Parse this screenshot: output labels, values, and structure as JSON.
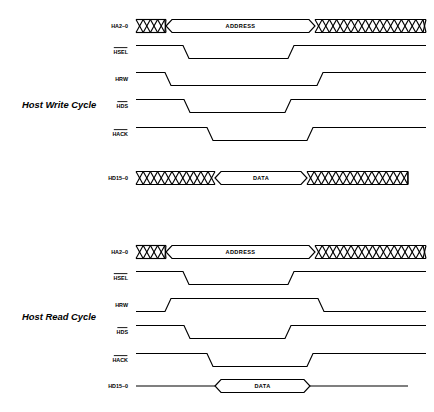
{
  "figure": {
    "title_faint": "",
    "width": 434,
    "height": 412,
    "background_color": "#ffffff",
    "line_color": "#000000"
  },
  "cycles": [
    {
      "id": "write",
      "title": "Host Write Cycle",
      "signals": [
        {
          "name": "HA2-0",
          "label": "HA2–0",
          "overbar": false,
          "type": "bus",
          "segments": [
            {
              "kind": "hatched",
              "start": 136,
              "end": 166
            },
            {
              "kind": "valid",
              "start": 166,
              "end": 315,
              "text": "ADDRESS"
            },
            {
              "kind": "hatched",
              "start": 315,
              "end": 426
            }
          ]
        },
        {
          "name": "HSEL",
          "label": "HSEL",
          "overbar": true,
          "type": "logic",
          "initial": "high",
          "transitions": [
            {
              "at": 183,
              "to": "low"
            },
            {
              "at": 288,
              "to": "high"
            }
          ]
        },
        {
          "name": "HRW",
          "label": "HRW",
          "overbar": false,
          "type": "logic",
          "initial": "high",
          "transitions": [
            {
              "at": 165,
              "to": "low"
            },
            {
              "at": 317,
              "to": "high"
            }
          ]
        },
        {
          "name": "HDS",
          "label": "HDS",
          "overbar": true,
          "type": "logic",
          "initial": "high",
          "transitions": [
            {
              "at": 184,
              "to": "low"
            },
            {
              "at": 285,
              "to": "high"
            }
          ]
        },
        {
          "name": "HACK",
          "label": "HACK",
          "overbar": true,
          "type": "logic",
          "initial": "high",
          "transitions": [
            {
              "at": 207,
              "to": "low"
            },
            {
              "at": 307,
              "to": "high"
            }
          ]
        },
        {
          "name": "HD15-0",
          "label": "HD15–0",
          "overbar": false,
          "type": "bus",
          "segments": [
            {
              "kind": "hatched",
              "start": 136,
              "end": 215
            },
            {
              "kind": "valid",
              "start": 215,
              "end": 307,
              "text": "DATA"
            },
            {
              "kind": "hatched",
              "start": 307,
              "end": 408
            }
          ]
        }
      ]
    },
    {
      "id": "read",
      "title": "Host Read Cycle",
      "signals": [
        {
          "name": "HA2-0",
          "label": "HA2–0",
          "overbar": false,
          "type": "bus",
          "segments": [
            {
              "kind": "hatched",
              "start": 136,
              "end": 166
            },
            {
              "kind": "valid",
              "start": 166,
              "end": 315,
              "text": "ADDRESS"
            },
            {
              "kind": "hatched",
              "start": 315,
              "end": 426
            }
          ]
        },
        {
          "name": "HSEL",
          "label": "HSEL",
          "overbar": true,
          "type": "logic",
          "initial": "high",
          "transitions": [
            {
              "at": 183,
              "to": "low"
            },
            {
              "at": 288,
              "to": "high"
            }
          ]
        },
        {
          "name": "HRW",
          "label": "HRW",
          "overbar": false,
          "type": "logic",
          "initial": "low",
          "transitions": [
            {
              "at": 165,
              "to": "high"
            },
            {
              "at": 318,
              "to": "low"
            }
          ]
        },
        {
          "name": "HDS",
          "label": "HDS",
          "overbar": true,
          "type": "logic",
          "initial": "high",
          "transitions": [
            {
              "at": 184,
              "to": "low"
            },
            {
              "at": 285,
              "to": "high"
            }
          ]
        },
        {
          "name": "HACK",
          "label": "HACK",
          "overbar": true,
          "type": "logic",
          "initial": "high",
          "transitions": [
            {
              "at": 207,
              "to": "low"
            },
            {
              "at": 307,
              "to": "high"
            }
          ]
        },
        {
          "name": "HD15-0",
          "label": "HD15–0",
          "overbar": false,
          "type": "bus",
          "segments": [
            {
              "kind": "line",
              "start": 136,
              "end": 215
            },
            {
              "kind": "valid",
              "start": 215,
              "end": 310,
              "text": "DATA"
            },
            {
              "kind": "line",
              "start": 310,
              "end": 408
            }
          ]
        }
      ]
    }
  ],
  "geometry": {
    "label_x": 128,
    "write_title_xy": [
      22,
      108
    ],
    "read_title_xy": [
      22,
      320
    ],
    "write_rows_y": [
      26,
      52,
      79,
      106,
      134,
      178
    ],
    "read_rows_y": [
      252,
      278,
      305,
      332,
      360,
      386
    ],
    "row_half_height": 6.5,
    "bus_half_height": 6.5,
    "edge_slope": 6,
    "hatch_pitch": 7.2
  }
}
